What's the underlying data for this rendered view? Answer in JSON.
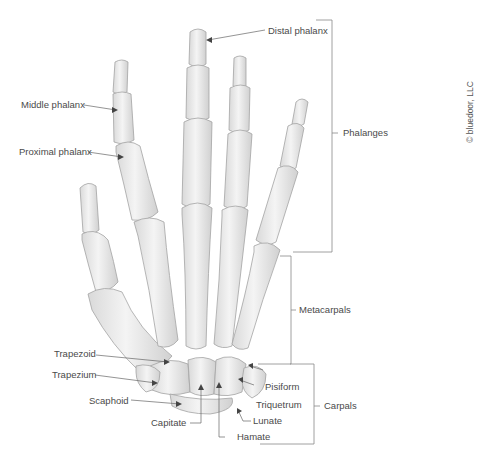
{
  "diagram": {
    "colors": {
      "bone_fill": "#ececec",
      "bone_stroke": "#9a9a9a",
      "bone_shade": "#d2d2d2",
      "leader": "#666666",
      "text": "#4a4a4a",
      "background": "#ffffff"
    },
    "labels": {
      "distal_phalanx": "Distal phalanx",
      "middle_phalanx": "Middle phalanx",
      "proximal_phalanx": "Proximal phalanx",
      "trapezoid": "Trapezoid",
      "trapezium": "Trapezium",
      "scaphoid": "Scaphoid",
      "capitate": "Capitate",
      "hamate": "Hamate",
      "lunate": "Lunate",
      "triquetrum": "Triquetrum",
      "pisiform": "Pisiform"
    },
    "groups": {
      "phalanges": "Phalanges",
      "metacarpals": "Metacarpals",
      "carpals": "Carpals"
    },
    "copyright": "© bluedoor, LLC"
  }
}
